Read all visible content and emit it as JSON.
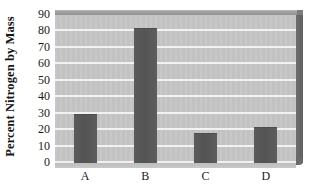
{
  "chart_data": {
    "type": "bar",
    "title": "",
    "subtitle": "",
    "xlabel": "",
    "ylabel": "Percent Nitrogen by Mass",
    "categories": [
      "A",
      "B",
      "C",
      "D"
    ],
    "values": [
      30,
      82,
      18,
      22
    ],
    "series": [
      {
        "name": "Percent Nitrogen by Mass",
        "values": [
          30,
          82,
          18,
          22
        ]
      }
    ],
    "ylim": [
      0,
      90
    ],
    "ytick_step": 10,
    "yticks": [
      0,
      10,
      20,
      30,
      40,
      50,
      60,
      70,
      80,
      90
    ],
    "ytick_labels": [
      "0",
      "10",
      "20",
      "30",
      "40",
      "50",
      "60",
      "70",
      "80",
      "90"
    ],
    "grid": true,
    "grid_axis": "y",
    "legend": false,
    "legend_position": "none",
    "annotations": [],
    "style": {
      "plot_background": "#c6c6c6",
      "gridline_color": "#f2f2f2",
      "bar_color": "#585858",
      "bevel_top_color": "#9a9a9a",
      "wall_right_color": "#6a6a6a",
      "text_color": "#1a1a1a",
      "page_background": "#ffffff",
      "three_d": true
    }
  }
}
